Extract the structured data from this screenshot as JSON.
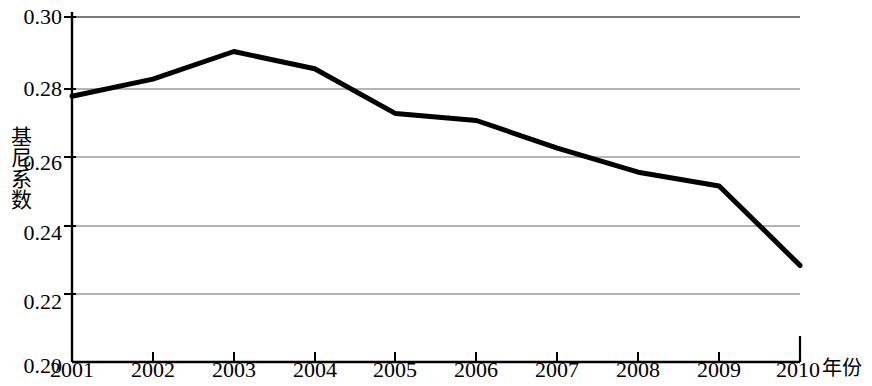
{
  "chart_data": {
    "type": "line",
    "title": "",
    "subtitle": "",
    "xlabel": "年份",
    "ylabel": "基尼系数",
    "categories": [
      "2001",
      "2002",
      "2003",
      "2004",
      "2005",
      "2006",
      "2007",
      "2008",
      "2009",
      "2010"
    ],
    "x": [
      2001,
      2002,
      2003,
      2004,
      2005,
      2006,
      2007,
      2008,
      2009,
      2010
    ],
    "values": [
      0.277,
      0.282,
      0.29,
      0.285,
      0.272,
      0.27,
      0.262,
      0.255,
      0.251,
      0.228
    ],
    "series": [
      {
        "name": "基尼系数",
        "values": [
          0.277,
          0.282,
          0.29,
          0.285,
          0.272,
          0.27,
          0.262,
          0.255,
          0.251,
          0.228
        ]
      }
    ],
    "ylim": [
      0.2,
      0.3
    ],
    "yticks": [
      "0.20",
      "0.22",
      "0.24",
      "0.26",
      "0.28",
      "0.30"
    ],
    "ytick_values": [
      0.2,
      0.22,
      0.24,
      0.26,
      0.28,
      0.3
    ],
    "xlim": [
      2001,
      2010
    ],
    "grid": "horizontal",
    "legend": "none",
    "line_color": "#000000",
    "grid_color": "#6b6b6b",
    "axis_color": "#000000",
    "background_color": "#ffffff"
  },
  "axes": {
    "y_title": "基尼系数",
    "x_title": "年份",
    "y_ticks": [
      {
        "label": "0.30",
        "value": 0.3
      },
      {
        "label": "0.28",
        "value": 0.28
      },
      {
        "label": "0.26",
        "value": 0.26
      },
      {
        "label": "0.24",
        "value": 0.24
      },
      {
        "label": "0.22",
        "value": 0.22
      },
      {
        "label": "0.20",
        "value": 0.2
      }
    ],
    "x_ticks": [
      {
        "label": "2001"
      },
      {
        "label": "2002"
      },
      {
        "label": "2003"
      },
      {
        "label": "2004"
      },
      {
        "label": "2005"
      },
      {
        "label": "2006"
      },
      {
        "label": "2007"
      },
      {
        "label": "2008"
      },
      {
        "label": "2009"
      },
      {
        "label": "2010"
      }
    ]
  }
}
